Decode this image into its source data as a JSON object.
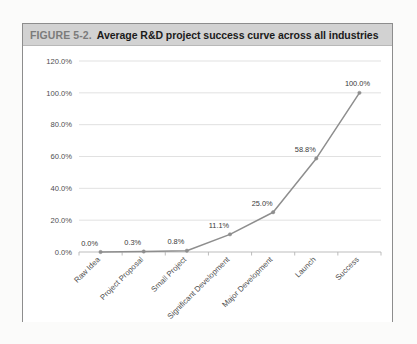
{
  "figure": {
    "number_label": "FIGURE 5-2.",
    "title": "Average R&D project success curve across all industries"
  },
  "chart_data": {
    "type": "line",
    "title": "Average R&D project success curve across all industries",
    "xlabel": "",
    "ylabel": "",
    "categories": [
      "Raw Idea",
      "Project Proposal",
      "Small Project",
      "Significant Development",
      "Major Development",
      "Launch",
      "Success"
    ],
    "values": [
      0.0,
      0.3,
      0.8,
      11.1,
      25.0,
      58.8,
      100.0
    ],
    "point_labels": [
      "0.0%",
      "0.3%",
      "0.8%",
      "11.1%",
      "25.0%",
      "58.8%",
      "100.0%"
    ],
    "ylim": [
      0,
      120
    ],
    "ytick_values": [
      0,
      20,
      40,
      60,
      80,
      100,
      120
    ],
    "ytick_labels": [
      "0.0%",
      "20.0%",
      "40.0%",
      "60.0%",
      "80.0%",
      "100.0%",
      "120.0%"
    ],
    "grid": true,
    "legend": false,
    "series_color": "#8e8e8e",
    "gridline_color": "#dedede",
    "xtick_rotation_deg": -45
  },
  "style": {
    "caption_bg": "#d2d2d2",
    "caption_num_color": "#7b7b7b",
    "caption_text_color": "#1b1b1b",
    "frame_border": "#8d8d8d",
    "page_bg": "#fbfbfa"
  }
}
